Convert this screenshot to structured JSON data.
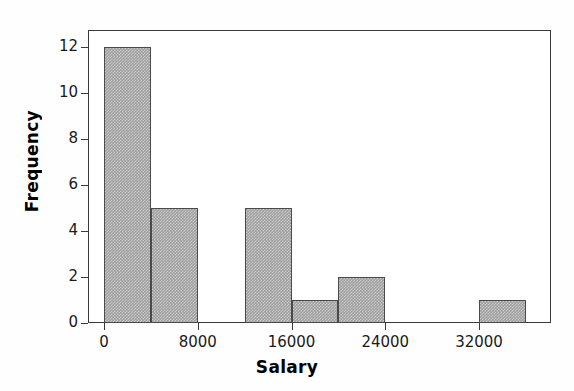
{
  "chart_data": {
    "type": "bar",
    "title": "",
    "subtitle": "",
    "xlabel": "Salary",
    "ylabel": "Frequency",
    "xlim": [
      -1200,
      38300
    ],
    "ylim": [
      0,
      12.8
    ],
    "bin_width": 4000,
    "grid": false,
    "legend": null,
    "xticks": [
      0,
      8000,
      16000,
      24000,
      32000
    ],
    "xtick_labels": [
      "0",
      "8000",
      "16000",
      "24000",
      "32000"
    ],
    "yticks": [
      0,
      2,
      4,
      6,
      8,
      10,
      12
    ],
    "ytick_labels": [
      "0",
      "2",
      "4",
      "6",
      "8",
      "10",
      "12"
    ],
    "bins": [
      {
        "start": 0,
        "end": 4000,
        "label": "0-4000",
        "value": 12
      },
      {
        "start": 4000,
        "end": 8000,
        "label": "4000-8000",
        "value": 5
      },
      {
        "start": 8000,
        "end": 12000,
        "label": "8000-12000",
        "value": 0
      },
      {
        "start": 12000,
        "end": 16000,
        "label": "12000-16000",
        "value": 5
      },
      {
        "start": 16000,
        "end": 20000,
        "label": "16000-20000",
        "value": 1
      },
      {
        "start": 20000,
        "end": 24000,
        "label": "20000-24000",
        "value": 2
      },
      {
        "start": 24000,
        "end": 28000,
        "label": "24000-28000",
        "value": 0
      },
      {
        "start": 28000,
        "end": 32000,
        "label": "28000-32000",
        "value": 0
      },
      {
        "start": 32000,
        "end": 36000,
        "label": "32000-36000",
        "value": 1
      }
    ],
    "categories": [
      "0-4000",
      "4000-8000",
      "8000-12000",
      "12000-16000",
      "16000-20000",
      "20000-24000",
      "24000-28000",
      "28000-32000",
      "32000-36000"
    ],
    "values": [
      12,
      5,
      0,
      5,
      1,
      2,
      0,
      0,
      1
    ],
    "total_count": 26,
    "colors": {
      "bar_fill": "#a0a0a0",
      "bar_border": "#4a4a4a",
      "frame": "#3a3a3a",
      "text": "#1a1a1a",
      "background": "#ffffff"
    }
  }
}
